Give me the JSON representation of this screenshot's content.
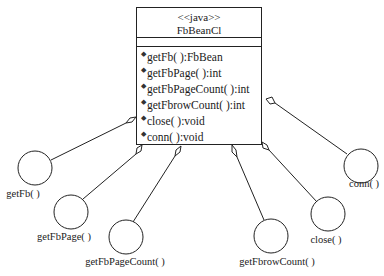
{
  "class": {
    "stereotype": "<<java>>",
    "name": "FbBeanCl",
    "methods": [
      {
        "icon": "method-icon",
        "signature": "getFb( ):FbBean"
      },
      {
        "icon": "method-icon",
        "signature": "getFbPage( ):int"
      },
      {
        "icon": "method-icon",
        "signature": "getFbPageCount( ):int"
      },
      {
        "icon": "method-icon",
        "signature": "getFbrowCount( ):int"
      },
      {
        "icon": "method-icon",
        "signature": "close( ):void"
      },
      {
        "icon": "method-icon",
        "signature": "conn( ):void"
      }
    ]
  },
  "interfaces": [
    {
      "label": "getFb( )"
    },
    {
      "label": "getFbPage( )"
    },
    {
      "label": "getFbPageCount( )"
    },
    {
      "label": "getFbrowCount( )"
    },
    {
      "label": "close( )"
    },
    {
      "label": "conn( )"
    }
  ],
  "colors": {
    "line": "#222222",
    "background": "#ffffff"
  }
}
